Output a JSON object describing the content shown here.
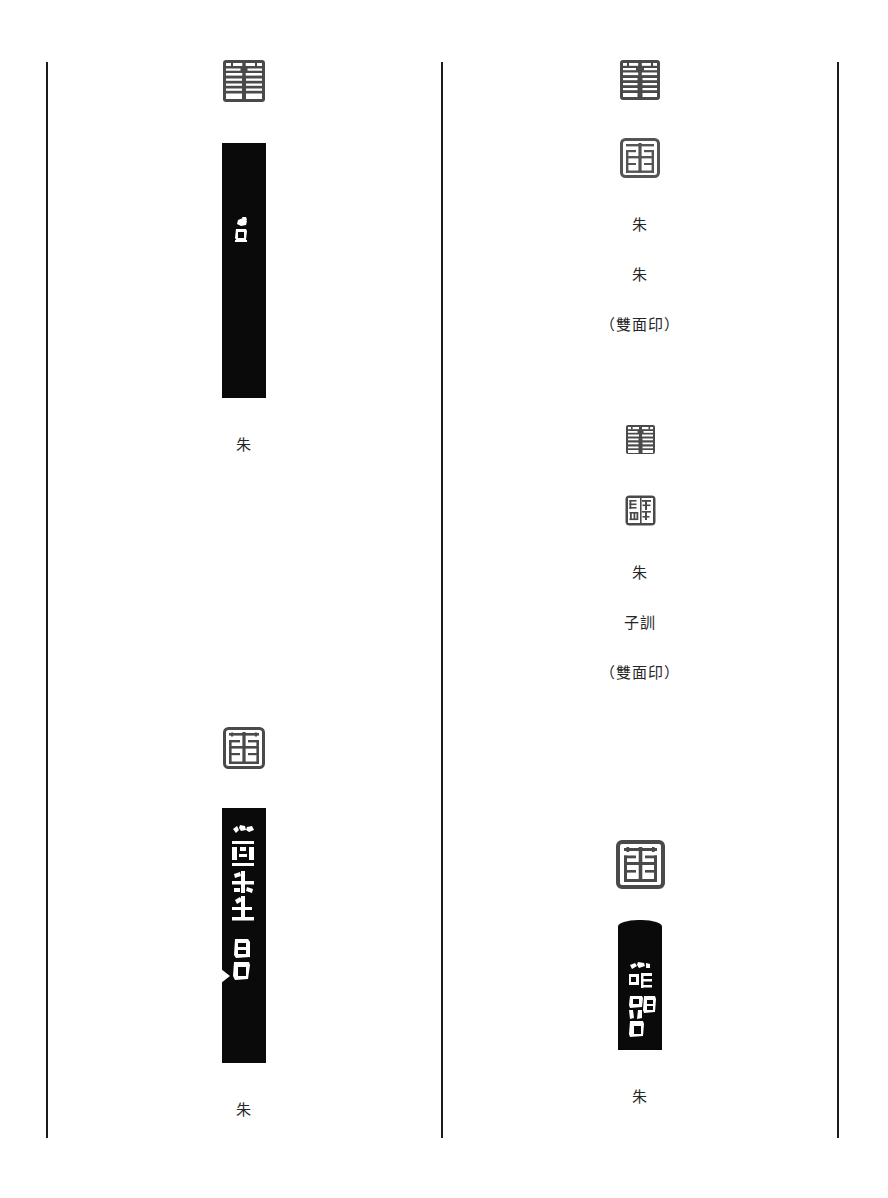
{
  "page": {
    "type": "seal-catalogue-page",
    "background_color": "#ffffff",
    "ink_color": "#0a0a0a",
    "rule_color": "#1c1c1c",
    "columns": 2
  },
  "rules": {
    "left_label": "left-column-rule",
    "middle_label": "column-divider-rule",
    "right_label": "right-column-rule"
  },
  "left_column": {
    "entries": [
      {
        "id": "entry-1",
        "seal_impression_label": "seal-impression",
        "seal_characters": "朱",
        "rubbing_label": "side-rubbing",
        "rubbing_inscription": "白石",
        "caption_lines": [
          "朱"
        ]
      },
      {
        "id": "entry-2",
        "seal_impression_label": "seal-impression",
        "seal_characters": "朱",
        "rubbing_label": "side-rubbing",
        "rubbing_inscription": "心畬先生 白石",
        "caption_lines": [
          "朱"
        ]
      }
    ]
  },
  "right_column": {
    "entries": [
      {
        "id": "entry-3",
        "seal_impression_label": "seal-impression-recto",
        "seal_impression_label_2": "seal-impression-verso",
        "seal_characters": "朱",
        "seal_characters_2": "朱",
        "caption_lines": [
          "朱",
          "朱",
          "（雙面印）"
        ]
      },
      {
        "id": "entry-4",
        "seal_impression_label": "seal-impression-recto",
        "seal_impression_label_2": "seal-impression-verso",
        "seal_characters": "朱",
        "seal_characters_2": "子訓",
        "caption_lines": [
          "朱",
          "子訓",
          "（雙面印）"
        ]
      },
      {
        "id": "entry-5",
        "seal_impression_label": "seal-impression",
        "seal_characters": "朱",
        "rubbing_label": "side-rubbing",
        "rubbing_inscription": "暗兄白石",
        "caption_lines": [
          "朱"
        ]
      }
    ]
  },
  "captions": {
    "c1": "朱",
    "c2": "朱",
    "c3_l1": "朱",
    "c3_l2": "朱",
    "c3_l3": "（雙面印）",
    "c4_l1": "朱",
    "c4_l2": "子訓",
    "c4_l3": "（雙面印）",
    "c5": "朱"
  }
}
